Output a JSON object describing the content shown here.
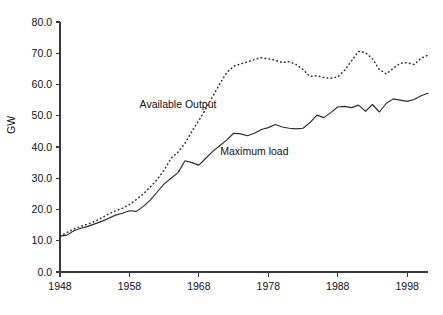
{
  "chart_data": {
    "type": "line",
    "title": "",
    "subtitle": "",
    "xlabel": "",
    "ylabel": "GW",
    "xlim": [
      1948,
      2001
    ],
    "ylim": [
      0.0,
      80.0
    ],
    "grid": false,
    "legend_position": "inline-annotations",
    "x_tick_labels": [
      "1948",
      "1958",
      "1968",
      "1978",
      "1988",
      "1998"
    ],
    "x_ticks": [
      1948,
      1958,
      1968,
      1978,
      1988,
      1998
    ],
    "y_tick_labels": [
      "0.0",
      "10.0",
      "20.0",
      "30.0",
      "40.0",
      "50.0",
      "60.0",
      "70.0",
      "80.0"
    ],
    "y_ticks": [
      0.0,
      10.0,
      20.0,
      30.0,
      40.0,
      50.0,
      60.0,
      70.0,
      80.0
    ],
    "annotations": [
      {
        "text": "Available Output",
        "x": 1965,
        "y": 52.5
      },
      {
        "text": "Maximum load",
        "x": 1976,
        "y": 37.5
      }
    ],
    "x": [
      1948,
      1949,
      1950,
      1951,
      1952,
      1953,
      1954,
      1955,
      1956,
      1957,
      1958,
      1959,
      1960,
      1961,
      1962,
      1963,
      1964,
      1965,
      1966,
      1967,
      1968,
      1969,
      1970,
      1971,
      1972,
      1973,
      1974,
      1975,
      1976,
      1977,
      1978,
      1979,
      1980,
      1981,
      1982,
      1983,
      1984,
      1985,
      1986,
      1987,
      1988,
      1989,
      1990,
      1991,
      1992,
      1993,
      1994,
      1995,
      1996,
      1997,
      1998,
      1999,
      2000,
      2001
    ],
    "series": [
      {
        "name": "Available Output",
        "style": "dotted",
        "color": "#2b2b2b",
        "values": [
          11.6,
          12.6,
          13.8,
          14.6,
          15.3,
          16.2,
          17.3,
          18.6,
          19.6,
          20.4,
          21.6,
          23.2,
          25.0,
          27.2,
          29.6,
          32.6,
          36.4,
          38.4,
          41.2,
          45.0,
          48.5,
          52.2,
          56.2,
          60.2,
          63.8,
          65.8,
          66.6,
          67.2,
          68.0,
          68.6,
          68.2,
          67.8,
          67.0,
          67.3,
          66.4,
          64.8,
          62.6,
          62.8,
          62.2,
          62.0,
          62.4,
          64.6,
          67.6,
          70.6,
          70.2,
          68.2,
          64.8,
          63.4,
          65.2,
          66.8,
          67.0,
          66.4,
          68.4,
          69.4
        ]
      },
      {
        "name": "Maximum load",
        "style": "solid",
        "color": "#2b2b2b",
        "values": [
          11.5,
          11.8,
          13.2,
          14.0,
          14.6,
          15.4,
          16.2,
          17.2,
          18.2,
          18.8,
          19.6,
          19.4,
          21.0,
          23.0,
          25.6,
          28.2,
          30.0,
          31.8,
          35.6,
          35.0,
          34.2,
          36.4,
          38.6,
          40.4,
          42.2,
          44.4,
          44.2,
          43.6,
          44.4,
          45.6,
          46.2,
          47.2,
          46.4,
          46.0,
          45.8,
          46.0,
          47.8,
          50.2,
          49.4,
          51.0,
          52.8,
          53.0,
          52.6,
          53.4,
          51.4,
          53.6,
          51.2,
          54.0,
          55.4,
          55.0,
          54.6,
          55.2,
          56.4,
          57.2
        ]
      }
    ]
  },
  "geometry": {
    "plot_left": 60,
    "plot_right": 428,
    "plot_top": 22,
    "plot_bottom": 272
  }
}
